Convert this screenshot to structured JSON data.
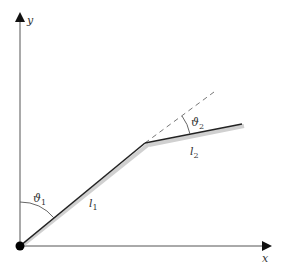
{
  "diagram": {
    "type": "two-link planar arm",
    "axes": {
      "x_label": "x",
      "y_label": "y"
    },
    "links": [
      {
        "name": "l",
        "subscript": "1"
      },
      {
        "name": "l",
        "subscript": "2"
      }
    ],
    "angles": [
      {
        "name": "ϑ",
        "subscript": "1"
      },
      {
        "name": "ϑ",
        "subscript": "2"
      }
    ],
    "colors": {
      "axis": "#555555",
      "link": "#222222",
      "link_shadow": "#cccccc",
      "dashed": "#777777",
      "base_joint": "#000000"
    }
  }
}
